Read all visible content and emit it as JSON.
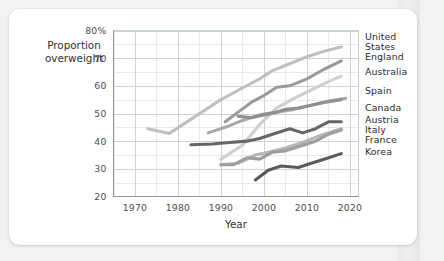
{
  "chart_data": {
    "type": "line",
    "title": "",
    "xlabel": "Year",
    "ylabel": "Proportion overweight",
    "xlim": [
      1965,
      2022
    ],
    "ylim": [
      20,
      80
    ],
    "xticks": [
      1970,
      1980,
      1990,
      2000,
      2010,
      2020
    ],
    "xtick_labels": [
      "1970",
      "1980",
      "1990",
      "2000",
      "2010",
      "2020"
    ],
    "yticks": [
      20,
      30,
      40,
      50,
      60,
      70,
      80
    ],
    "ytick_labels": [
      "20",
      "30",
      "40",
      "50",
      "60",
      "70",
      "80%"
    ],
    "grid": true,
    "grid_minor_x_step": 5,
    "grid_minor_y_step": 5,
    "legend_position": "right-inline-labels",
    "value_unit": "percent",
    "series": [
      {
        "name": "United States",
        "label": "United States",
        "color": "#c0c0c0",
        "label_x": 2022,
        "label_y": 76.5,
        "x": [
          1973,
          1978,
          1990,
          1994,
          1999,
          2002,
          2006,
          2010,
          2014,
          2018
        ],
        "values": [
          44.5,
          42.8,
          55.0,
          58.4,
          62.5,
          65.5,
          68.0,
          70.5,
          72.5,
          74.0
        ]
      },
      {
        "name": "England",
        "label": "England",
        "color": "#9a9a9a",
        "label_x": 2022,
        "label_y": 69.5,
        "x": [
          1991,
          1994,
          1997,
          2000,
          2003,
          2006,
          2010,
          2014,
          2018
        ],
        "values": [
          47.0,
          50.5,
          54.0,
          56.5,
          59.5,
          60.0,
          62.5,
          66.0,
          69.0
        ]
      },
      {
        "name": "Australia",
        "label": "Australia",
        "color": "#cfcfcf",
        "label_x": 2022,
        "label_y": 64.0,
        "x": [
          1990,
          1995,
          1999,
          2003,
          2007,
          2011,
          2015,
          2018
        ],
        "values": [
          33.5,
          38.5,
          46.0,
          52.0,
          55.5,
          58.5,
          61.5,
          63.5
        ]
      },
      {
        "name": "Spain",
        "label": "Spain",
        "color": "#a8a8a8",
        "label_x": 2022,
        "label_y": 57.0,
        "x": [
          1987,
          1991,
          1995,
          1999,
          2003,
          2007,
          2011,
          2015,
          2019
        ],
        "values": [
          43.0,
          45.0,
          47.5,
          49.5,
          50.5,
          51.5,
          53.0,
          54.5,
          55.5
        ]
      },
      {
        "name": "Canada",
        "label": "Canada",
        "color": "#8f8f8f",
        "label_x": 2022,
        "label_y": 51.0,
        "x": [
          1994,
          1997,
          2000,
          2003,
          2005,
          2008,
          2011,
          2014,
          2018
        ],
        "values": [
          49.0,
          48.5,
          49.5,
          50.5,
          51.5,
          52.0,
          53.0,
          54.0,
          55.0
        ]
      },
      {
        "name": "Austria",
        "label": "Austria",
        "color": "#666666",
        "label_x": 2022,
        "label_y": 46.5,
        "x": [
          1983,
          1988,
          1992,
          1996,
          1999,
          2002,
          2006,
          2009,
          2012,
          2015,
          2018
        ],
        "values": [
          38.7,
          39.0,
          39.5,
          40.0,
          41.0,
          42.5,
          44.5,
          43.0,
          44.5,
          47.0,
          47.0
        ]
      },
      {
        "name": "Italy",
        "label": "Italy",
        "color": "#b5b5b5",
        "label_x": 2022,
        "label_y": 43.0,
        "x": [
          1990,
          1994,
          1998,
          2001,
          2005,
          2009,
          2013,
          2018
        ],
        "values": [
          31.5,
          32.0,
          35.0,
          36.0,
          37.5,
          39.5,
          42.0,
          44.5
        ]
      },
      {
        "name": "France",
        "label": "France",
        "color": "#9e9e9e",
        "label_x": 2022,
        "label_y": 39.5,
        "x": [
          1990,
          1993,
          1996,
          1999,
          2002,
          2005,
          2008,
          2012,
          2015,
          2018
        ],
        "values": [
          31.5,
          31.5,
          34.0,
          33.5,
          36.0,
          36.5,
          38.0,
          40.0,
          42.5,
          44.0
        ]
      },
      {
        "name": "Korea",
        "label": "Korea",
        "color": "#5a5a5a",
        "label_x": 2022,
        "label_y": 35.0,
        "x": [
          1998,
          2001,
          2004,
          2008,
          2011,
          2014,
          2018
        ],
        "values": [
          26.0,
          29.5,
          31.0,
          30.5,
          32.0,
          33.5,
          35.5
        ]
      }
    ]
  },
  "figure": {
    "y_axis_title": "Proportion overweight",
    "y_axis_title_line1": "Proportion",
    "y_axis_title_line2": "overweight",
    "x_axis_title": "Year"
  }
}
